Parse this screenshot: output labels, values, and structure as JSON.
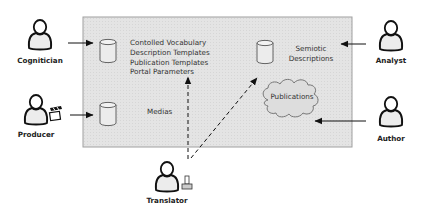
{
  "diagram": {
    "system_box": {
      "fill": "#e3e3e3",
      "stroke": "#9a9a9a"
    },
    "actors": [
      {
        "id": "cognitician",
        "label": "Cognitician"
      },
      {
        "id": "producer",
        "label": "Producer",
        "accessory": "clapperboard-icon"
      },
      {
        "id": "translator",
        "label": "Translator",
        "accessory": "printer-icon"
      },
      {
        "id": "analyst",
        "label": "Analyst"
      },
      {
        "id": "author",
        "label": "Author"
      }
    ],
    "stores": [
      {
        "id": "resources",
        "lines": [
          "Contolled Vocabulary",
          "Description Templates",
          "Publication Templates",
          "Portal Parameters"
        ]
      },
      {
        "id": "medias",
        "lines": [
          "Medias"
        ]
      },
      {
        "id": "semiotic",
        "lines": [
          "Semiotic",
          "Descriptions"
        ]
      }
    ],
    "cloud": {
      "id": "publications",
      "label": "Publications"
    },
    "connections": [
      {
        "from": "cognitician",
        "to": "resources",
        "style": "solid"
      },
      {
        "from": "producer",
        "to": "medias",
        "style": "solid"
      },
      {
        "from": "analyst",
        "to": "semiotic",
        "style": "solid"
      },
      {
        "from": "author",
        "to": "publications",
        "style": "solid"
      },
      {
        "from": "translator",
        "to": "resources",
        "style": "dashed"
      },
      {
        "from": "translator",
        "to": "semiotic",
        "style": "dashed"
      }
    ]
  }
}
